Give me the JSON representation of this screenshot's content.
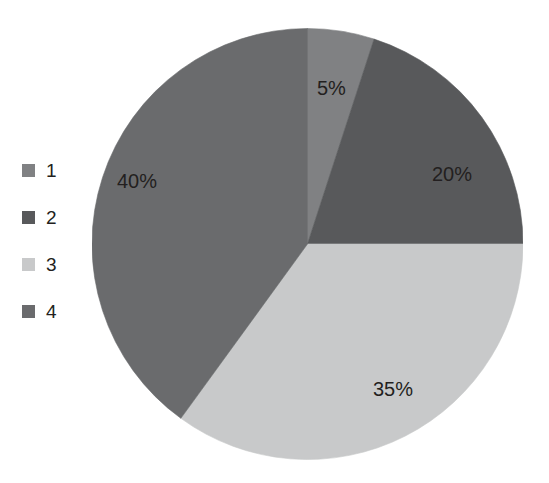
{
  "chart_data": {
    "type": "pie",
    "title": "",
    "subtitle": "",
    "xlabel": "",
    "ylabel": "",
    "grid": false,
    "legend_position": "left",
    "start_angle_deg": 0,
    "direction": "clockwise",
    "categories": [
      "1",
      "2",
      "3",
      "4"
    ],
    "values": [
      5,
      20,
      35,
      40
    ],
    "labels": [
      "5%",
      "20%",
      "35%",
      "40%"
    ],
    "colors": [
      "#808183",
      "#58595b",
      "#c8c9ca",
      "#6a6b6d"
    ],
    "label_color": "#231f20",
    "background": "#ffffff",
    "slices": [
      {
        "category": "1",
        "value": 5,
        "label": "5%",
        "color": "#808183"
      },
      {
        "category": "2",
        "value": 20,
        "label": "20%",
        "color": "#58595b"
      },
      {
        "category": "3",
        "value": 35,
        "label": "35%",
        "color": "#c8c9ca"
      },
      {
        "category": "4",
        "value": 40,
        "label": "40%",
        "color": "#6a6b6d"
      }
    ]
  },
  "legend": {
    "items": [
      {
        "label": "1",
        "color": "#808183"
      },
      {
        "label": "2",
        "color": "#58595b"
      },
      {
        "label": "3",
        "color": "#c8c9ca"
      },
      {
        "label": "4",
        "color": "#6a6b6d"
      }
    ]
  }
}
